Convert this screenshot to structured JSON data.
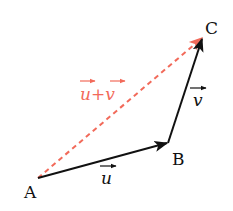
{
  "diagram": {
    "colors": {
      "vector": "#111111",
      "resultant": "#f26a5a",
      "background": "#ffffff"
    },
    "points": [
      {
        "id": "A",
        "label": "A",
        "x": 38,
        "y": 178
      },
      {
        "id": "B",
        "label": "B",
        "x": 168,
        "y": 143
      },
      {
        "id": "C",
        "label": "C",
        "x": 203,
        "y": 37
      }
    ],
    "vectors": [
      {
        "id": "u",
        "from": "A",
        "to": "B",
        "label": "u",
        "style": "solid"
      },
      {
        "id": "v",
        "from": "B",
        "to": "C",
        "label": "v",
        "style": "solid"
      },
      {
        "id": "u_plus_v",
        "from": "A",
        "to": "C",
        "label_parts": [
          "u",
          "+",
          "v"
        ],
        "style": "dashed"
      }
    ]
  }
}
